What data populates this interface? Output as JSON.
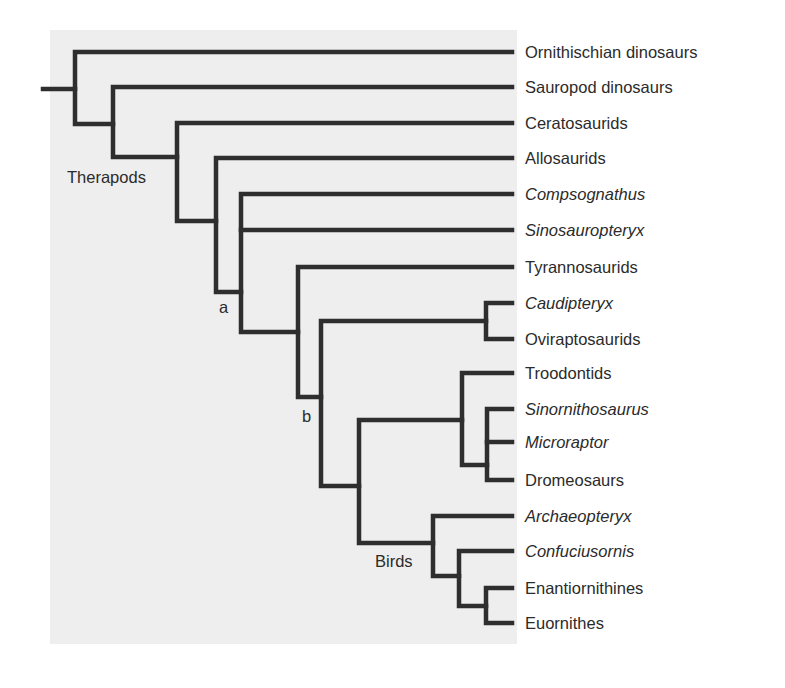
{
  "figure": {
    "type": "cladogram",
    "background_color": "#eeeeee",
    "line_color": "#2e2e2e",
    "text_color": "#2b2b2b"
  },
  "taxa": [
    {
      "name": "Ornithischian dinosaurs",
      "italic": false
    },
    {
      "name": "Sauropod dinosaurs",
      "italic": false
    },
    {
      "name": "Ceratosaurids",
      "italic": false
    },
    {
      "name": "Allosaurids",
      "italic": false
    },
    {
      "name": "Compsognathus",
      "italic": true
    },
    {
      "name": "Sinosauropteryx",
      "italic": true
    },
    {
      "name": "Tyrannosaurids",
      "italic": false
    },
    {
      "name": "Caudipteryx",
      "italic": true
    },
    {
      "name": "Oviraptosaurids",
      "italic": false
    },
    {
      "name": "Troodontids",
      "italic": false
    },
    {
      "name": "Sinornithosaurus",
      "italic": true
    },
    {
      "name": "Microraptor",
      "italic": true
    },
    {
      "name": "Dromeosaurs",
      "italic": false
    },
    {
      "name": "Archaeopteryx",
      "italic": true
    },
    {
      "name": "Confuciusornis",
      "italic": true
    },
    {
      "name": "Enantiornithines",
      "italic": false
    },
    {
      "name": "Euornithes",
      "italic": false
    }
  ],
  "clade_labels": {
    "therapods": "Therapods",
    "node_a": "a",
    "node_b": "b",
    "birds": "Birds"
  },
  "topology_newick": "(Ornithischian dinosaurs,(Sauropod dinosaurs,(Ceratosaurids,(Allosaurids,(Compsognathus,Sinosauropteryx,(Tyrannosaurids,((Caudipteryx,Oviraptosaurids),((Troodontids,(Sinornithosaurus,Microraptor,Dromeosaurs)),(Archaeopteryx,(Confuciusornis,(Enantiornithines,Euornithes)))))))))));"
}
